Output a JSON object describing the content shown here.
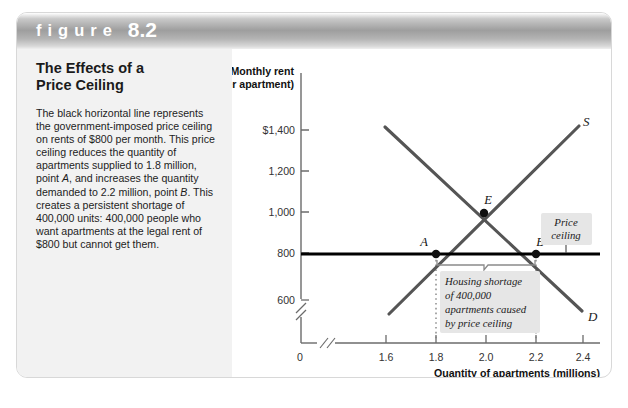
{
  "figure": {
    "word": "figure",
    "number": "8.2",
    "title_line1": "The Effects of a",
    "title_line2": "Price Ceiling",
    "caption": "The black horizontal line represents the government-imposed price ceiling on rents of $800 per month. This price ceiling reduces the quantity of apartments supplied to 1.8 million, point A, and increases the quantity demanded to 2.2 million, point B. This creates a persistent shortage of 400,000 units: 400,000 people who want apartments at the legal rent of $800 but cannot get them."
  },
  "chart_data": {
    "type": "line",
    "title": "",
    "ylabel_line1": "Monthly rent",
    "ylabel_line2": "(per apartment)",
    "xlabel": "Quantity of apartments (millions)",
    "xticks": [
      "1.6",
      "1.8",
      "2.0",
      "2.2",
      "2.4"
    ],
    "xtick_values": [
      1.6,
      1.8,
      2.0,
      2.2,
      2.4
    ],
    "yticks": [
      "$1,400",
      "1,200",
      "1,000",
      "800",
      "600"
    ],
    "ytick_values": [
      1400,
      1200,
      1000,
      800,
      600
    ],
    "origin_label": "0",
    "xlim": [
      1.5,
      2.5
    ],
    "ylim": [
      560,
      1440
    ],
    "axis_break_x": true,
    "axis_break_y": true,
    "grid": false,
    "series": [
      {
        "name": "Demand",
        "label": "D",
        "type": "line",
        "x": [
          1.58,
          2.42
        ],
        "y": [
          1400,
          615
        ]
      },
      {
        "name": "Supply",
        "label": "S",
        "type": "line",
        "x": [
          1.605,
          2.39
        ],
        "y": [
          600,
          1420
        ]
      },
      {
        "name": "Price ceiling",
        "label": "Price ceiling",
        "type": "horizontal-line",
        "y": 800,
        "color": "#000000"
      }
    ],
    "points": [
      {
        "label": "A",
        "x": 1.8,
        "y": 800
      },
      {
        "label": "B",
        "x": 2.2,
        "y": 800
      },
      {
        "label": "E",
        "x": 2.0,
        "y": 1000
      }
    ],
    "annotations": [
      {
        "name": "price-ceiling-callout",
        "line1": "Price",
        "line2": "ceiling"
      },
      {
        "name": "housing-shortage-callout",
        "line1": "Housing shortage",
        "line2": "of 400,000",
        "line3": "apartments caused",
        "line4": "by price ceiling"
      }
    ],
    "colors": {
      "curve": "#555555",
      "ceiling": "#000000",
      "axis": "#6b6b6b",
      "callout_background": "#e6e6e6"
    }
  }
}
